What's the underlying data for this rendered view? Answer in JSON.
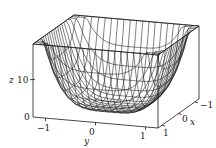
{
  "chart_data": {
    "type": "surface3d",
    "title": "",
    "function_shape": "bowl with steep corners, flat bottom (z ≈ 4(x^4 + y^4))",
    "xlabel": "x",
    "ylabel": "y",
    "zlabel": "z",
    "x_ticks": [
      "-1",
      "0",
      "1"
    ],
    "y_ticks": [
      "-1",
      "0",
      "1"
    ],
    "z_ticks": [
      "0",
      "10"
    ],
    "x_range": [
      -1.25,
      1.25
    ],
    "y_range": [
      -1.25,
      1.25
    ],
    "z_range": [
      0,
      19.5
    ],
    "grid_lines": 20,
    "style": "black wireframe mesh inside bounding box"
  },
  "labels": {
    "z_axis": "z",
    "z_tick_10": "10",
    "z_tick_0": "0",
    "y_axis": "y",
    "y_tick_neg1": "−1",
    "y_tick_0": "0",
    "y_tick_1": "1",
    "x_axis": "x",
    "x_tick_neg1": "−1",
    "x_tick_0": "0",
    "x_tick_1": "1"
  },
  "colors": {
    "line": "#1a1a1a",
    "background": "#ffffff"
  }
}
